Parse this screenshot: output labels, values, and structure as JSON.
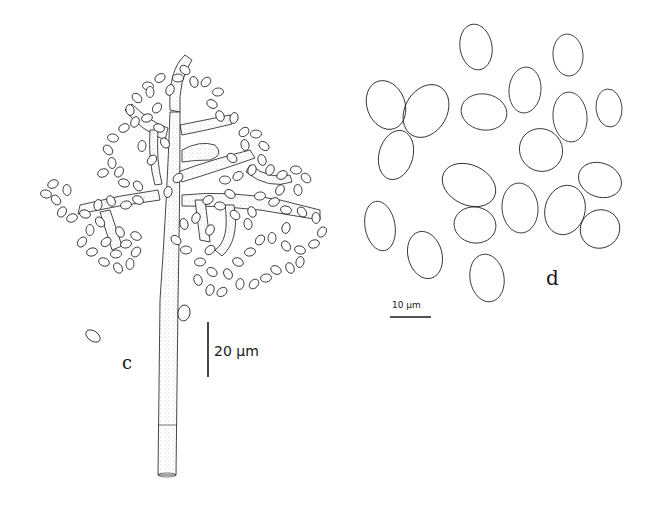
{
  "figure": {
    "panels": [
      {
        "id": "c",
        "label": "c",
        "subject": "conidiophore with conidia",
        "scale_bar": {
          "text": "20 µm",
          "orientation": "vertical",
          "x": 208,
          "y1": 322,
          "y2": 377
        }
      },
      {
        "id": "d",
        "label": "d",
        "subject": "conidia",
        "scale_bar": {
          "text": "10 µm",
          "orientation": "horizontal",
          "y": 317,
          "x1": 390,
          "x2": 431
        }
      }
    ],
    "colors": {
      "ink": "#1a1a1a",
      "background": "#ffffff",
      "stipple": "#8a8a8a"
    }
  },
  "conidia_d": [
    [
      476,
      47,
      16,
      23,
      -10
    ],
    [
      568,
      55,
      15,
      21,
      -5
    ],
    [
      386,
      105,
      19,
      25,
      -20
    ],
    [
      426,
      111,
      21,
      28,
      30
    ],
    [
      484,
      112,
      23,
      18,
      10
    ],
    [
      525,
      90,
      16,
      23,
      5
    ],
    [
      570,
      117,
      17,
      25,
      -5
    ],
    [
      609,
      108,
      13,
      19,
      -5
    ],
    [
      396,
      155,
      17,
      25,
      15
    ],
    [
      541,
      150,
      22,
      21,
      40
    ],
    [
      469,
      185,
      28,
      20,
      25
    ],
    [
      600,
      180,
      22,
      17,
      20
    ],
    [
      520,
      208,
      18,
      25,
      -5
    ],
    [
      565,
      210,
      20,
      25,
      15
    ],
    [
      475,
      225,
      21,
      18,
      10
    ],
    [
      380,
      226,
      15,
      25,
      -10
    ],
    [
      600,
      229,
      20,
      19,
      -30
    ],
    [
      425,
      255,
      17,
      24,
      -15
    ],
    [
      487,
      278,
      17,
      24,
      -10
    ]
  ],
  "conidia_c": [
    [
      178,
      78
    ],
    [
      185,
      70
    ],
    [
      194,
      82
    ],
    [
      170,
      90
    ],
    [
      160,
      78
    ],
    [
      148,
      86
    ],
    [
      137,
      98
    ],
    [
      130,
      110
    ],
    [
      135,
      122
    ],
    [
      124,
      128
    ],
    [
      113,
      138
    ],
    [
      108,
      150
    ],
    [
      112,
      163
    ],
    [
      119,
      172
    ],
    [
      103,
      173
    ],
    [
      124,
      183
    ],
    [
      138,
      186
    ],
    [
      150,
      92
    ],
    [
      157,
      108
    ],
    [
      147,
      118
    ],
    [
      159,
      128
    ],
    [
      165,
      143
    ],
    [
      142,
      146
    ],
    [
      152,
      160
    ],
    [
      126,
      205
    ],
    [
      138,
      200
    ],
    [
      111,
      201
    ],
    [
      98,
      205
    ],
    [
      206,
      82
    ],
    [
      218,
      92
    ],
    [
      212,
      104
    ],
    [
      220,
      116
    ],
    [
      234,
      118
    ],
    [
      244,
      132
    ],
    [
      256,
      134
    ],
    [
      264,
      146
    ],
    [
      262,
      160
    ],
    [
      252,
      170
    ],
    [
      238,
      176
    ],
    [
      225,
      180
    ],
    [
      232,
      158
    ],
    [
      245,
      145
    ],
    [
      270,
      170
    ],
    [
      282,
      175
    ],
    [
      296,
      170
    ],
    [
      306,
      178
    ],
    [
      298,
      190
    ],
    [
      280,
      190
    ],
    [
      274,
      202
    ],
    [
      286,
      210
    ],
    [
      302,
      212
    ],
    [
      316,
      218
    ],
    [
      322,
      232
    ],
    [
      314,
      244
    ],
    [
      300,
      250
    ],
    [
      286,
      246
    ],
    [
      272,
      238
    ],
    [
      260,
      240
    ],
    [
      250,
      252
    ],
    [
      238,
      262
    ],
    [
      228,
      274
    ],
    [
      240,
      284
    ],
    [
      254,
      284
    ],
    [
      266,
      278
    ],
    [
      276,
      270
    ],
    [
      290,
      268
    ],
    [
      300,
      262
    ],
    [
      210,
      250
    ],
    [
      200,
      262
    ],
    [
      212,
      272
    ],
    [
      198,
      280
    ],
    [
      210,
      290
    ],
    [
      222,
      292
    ],
    [
      186,
      250
    ],
    [
      176,
      240
    ],
    [
      184,
      224
    ],
    [
      196,
      218
    ],
    [
      208,
      200
    ],
    [
      220,
      206
    ],
    [
      235,
      215
    ],
    [
      248,
      224
    ],
    [
      210,
      230
    ],
    [
      53,
      184
    ],
    [
      46,
      194
    ],
    [
      56,
      200
    ],
    [
      67,
      190
    ],
    [
      62,
      212
    ],
    [
      72,
      218
    ],
    [
      85,
      214
    ],
    [
      100,
      222
    ],
    [
      90,
      230
    ],
    [
      82,
      242
    ],
    [
      92,
      252
    ],
    [
      104,
      262
    ],
    [
      118,
      268
    ],
    [
      130,
      264
    ],
    [
      136,
      252
    ],
    [
      126,
      244
    ],
    [
      136,
      236
    ],
    [
      120,
      232
    ],
    [
      168,
      192
    ],
    [
      178,
      178
    ],
    [
      260,
      196
    ],
    [
      230,
      194
    ],
    [
      252,
      212
    ],
    [
      286,
      228
    ],
    [
      106,
      242
    ],
    [
      116,
      254
    ]
  ],
  "free_conidia_c": [
    [
      93,
      336,
      8,
      5,
      35
    ],
    [
      184,
      313,
      6,
      8,
      10
    ]
  ]
}
